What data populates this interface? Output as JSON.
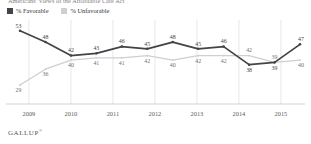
{
  "title": "Americans' Views of the Affordable Care Act",
  "legend": {
    "favorable_label": "% Favorable",
    "unfavorable_label": "% Unfavorable",
    "favorable_color": "#434349",
    "unfavorable_color": "#cfcfcf"
  },
  "footer": {
    "brand": "GALLUP",
    "mark": "®"
  },
  "chart_data": {
    "type": "line",
    "title": "Americans' Views of the Affordable Care Act",
    "xlabel": "",
    "ylabel": "",
    "grid": true,
    "legend_position": "top-left",
    "ylim": [
      25,
      56
    ],
    "xlim": [
      0,
      11
    ],
    "xtick_labels": [
      "2009",
      "2010",
      "2011",
      "2012",
      "2013",
      "2014",
      "2015"
    ],
    "xtick_positions": [
      0.35,
      2.0,
      3.65,
      5.3,
      6.95,
      8.6,
      10.25
    ],
    "x": [
      0,
      1,
      2,
      3,
      4,
      5,
      6,
      7,
      8,
      9,
      10,
      11
    ],
    "series": [
      {
        "name": "% Favorable",
        "color": "#434349",
        "values": [
          53,
          48,
          42,
          43,
          46,
          45,
          48,
          45,
          46,
          38,
          39,
          47
        ],
        "label_offsets": [
          "above",
          "above",
          "above",
          "above",
          "above",
          "above",
          "above",
          "above",
          "above",
          "below",
          "below",
          "above"
        ]
      },
      {
        "name": "% Unfavorable",
        "color": "#cfcfcf",
        "values": [
          29,
          36,
          40,
          41,
          41,
          42,
          40,
          42,
          42,
          42,
          39,
          40
        ],
        "label_offsets": [
          "below",
          "below",
          "below",
          "below",
          "below",
          "below",
          "below",
          "below",
          "below",
          "above",
          "above",
          "below"
        ]
      }
    ]
  }
}
